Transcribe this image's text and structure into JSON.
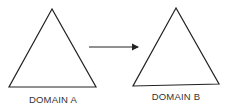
{
  "diagram": {
    "nodes": [
      {
        "id": "domain-a",
        "shape": "triangle",
        "label": "DOMAIN A"
      },
      {
        "id": "domain-b",
        "shape": "triangle",
        "label": "DOMAIN B"
      }
    ],
    "edges": [
      {
        "from": "domain-a",
        "to": "domain-b",
        "style": "arrow"
      }
    ],
    "colors": {
      "stroke": "#222222",
      "text": "#333333",
      "background": "#ffffff"
    }
  }
}
